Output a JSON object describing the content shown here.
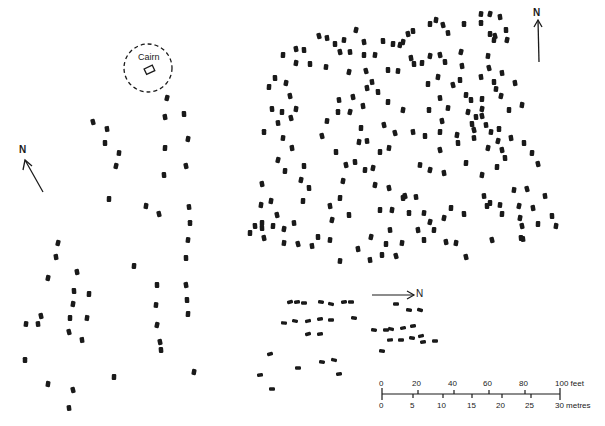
{
  "figure": {
    "type": "archaeological site plan",
    "ink_color": "#1a1a1a",
    "background": "#ffffff"
  },
  "labels": {
    "cairn": "Cairn",
    "north_left": "N",
    "north_right": "N",
    "north_bottom": "N"
  },
  "scale_bar": {
    "feet_ticks": [
      "0",
      "20",
      "40",
      "60",
      "80",
      "100 feet"
    ],
    "metre_ticks": [
      "0",
      "5",
      "10",
      "15",
      "20",
      "25",
      "30 metres"
    ],
    "feet_unit": "feet",
    "metre_unit": "metres"
  },
  "north_arrows": [
    {
      "id": "left",
      "x1": 43,
      "y1": 192,
      "x2": 25,
      "y2": 160,
      "label_x": 19,
      "label_y": 145
    },
    {
      "id": "right",
      "x1": 539,
      "y1": 62,
      "x2": 538,
      "y2": 20,
      "label_x": 533,
      "label_y": 8
    },
    {
      "id": "bottom",
      "x1": 372,
      "y1": 295,
      "x2": 414,
      "y2": 295,
      "label_x": 415,
      "label_y": 289
    }
  ],
  "stones": {
    "left_group": [
      [
        93,
        122
      ],
      [
        107,
        129
      ],
      [
        105,
        143
      ],
      [
        119,
        153
      ],
      [
        116,
        166
      ],
      [
        165,
        117
      ],
      [
        184,
        114
      ],
      [
        165,
        148
      ],
      [
        188,
        139
      ],
      [
        186,
        166
      ],
      [
        164,
        175
      ],
      [
        109,
        199
      ],
      [
        146,
        206
      ],
      [
        159,
        214
      ],
      [
        189,
        207
      ],
      [
        190,
        223
      ],
      [
        188,
        240
      ],
      [
        58,
        243
      ],
      [
        56,
        257
      ],
      [
        186,
        258
      ],
      [
        134,
        266
      ],
      [
        48,
        278
      ],
      [
        77,
        272
      ],
      [
        74,
        291
      ],
      [
        89,
        294
      ],
      [
        73,
        304
      ],
      [
        41,
        316
      ],
      [
        38,
        324
      ],
      [
        70,
        318
      ],
      [
        87,
        318
      ],
      [
        69,
        332
      ],
      [
        82,
        340
      ],
      [
        157,
        285
      ],
      [
        156,
        305
      ],
      [
        157,
        325
      ],
      [
        186,
        285
      ],
      [
        187,
        300
      ],
      [
        188,
        314
      ],
      [
        194,
        372
      ],
      [
        160,
        342
      ],
      [
        161,
        350
      ],
      [
        114,
        377
      ],
      [
        48,
        384
      ],
      [
        73,
        390
      ],
      [
        69,
        408
      ],
      [
        25,
        360
      ],
      [
        26,
        324
      ],
      [
        167,
        98
      ]
    ],
    "main_group": [
      [
        319,
        36
      ],
      [
        327,
        38
      ],
      [
        335,
        44
      ],
      [
        344,
        40
      ],
      [
        356,
        30
      ],
      [
        364,
        42
      ],
      [
        383,
        41
      ],
      [
        393,
        44
      ],
      [
        403,
        42
      ],
      [
        408,
        34
      ],
      [
        413,
        31
      ],
      [
        430,
        24
      ],
      [
        436,
        20
      ],
      [
        443,
        25
      ],
      [
        448,
        33
      ],
      [
        464,
        24
      ],
      [
        481,
        14
      ],
      [
        490,
        14
      ],
      [
        500,
        17
      ],
      [
        506,
        30
      ],
      [
        494,
        40
      ],
      [
        507,
        40
      ],
      [
        296,
        49
      ],
      [
        304,
        50
      ],
      [
        283,
        55
      ],
      [
        296,
        63
      ],
      [
        340,
        52
      ],
      [
        350,
        52
      ],
      [
        364,
        55
      ],
      [
        375,
        55
      ],
      [
        366,
        71
      ],
      [
        372,
        82
      ],
      [
        388,
        70
      ],
      [
        398,
        71
      ],
      [
        400,
        45
      ],
      [
        411,
        58
      ],
      [
        414,
        64
      ],
      [
        422,
        63
      ],
      [
        430,
        56
      ],
      [
        440,
        55
      ],
      [
        445,
        62
      ],
      [
        428,
        84
      ],
      [
        438,
        77
      ],
      [
        453,
        85
      ],
      [
        440,
        98
      ],
      [
        429,
        110
      ],
      [
        448,
        108
      ],
      [
        461,
        52
      ],
      [
        462,
        66
      ],
      [
        460,
        80
      ],
      [
        466,
        95
      ],
      [
        468,
        112
      ],
      [
        442,
        121
      ],
      [
        472,
        124
      ],
      [
        440,
        132
      ],
      [
        457,
        135
      ],
      [
        440,
        150
      ],
      [
        474,
        138
      ],
      [
        490,
        34
      ],
      [
        488,
        56
      ],
      [
        495,
        36
      ],
      [
        481,
        77
      ],
      [
        310,
        64
      ],
      [
        326,
        67
      ],
      [
        349,
        72
      ],
      [
        367,
        88
      ],
      [
        275,
        78
      ],
      [
        269,
        87
      ],
      [
        286,
        83
      ],
      [
        290,
        96
      ],
      [
        272,
        109
      ],
      [
        282,
        112
      ],
      [
        296,
        109
      ],
      [
        291,
        118
      ],
      [
        278,
        123
      ],
      [
        264,
        132
      ],
      [
        283,
        138
      ],
      [
        278,
        160
      ],
      [
        292,
        148
      ],
      [
        304,
        166
      ],
      [
        285,
        171
      ],
      [
        301,
        180
      ],
      [
        262,
        184
      ],
      [
        309,
        188
      ],
      [
        303,
        201
      ],
      [
        271,
        201
      ],
      [
        277,
        215
      ],
      [
        294,
        223
      ],
      [
        262,
        223
      ],
      [
        284,
        243
      ],
      [
        298,
        244
      ],
      [
        312,
        246
      ],
      [
        318,
        237
      ],
      [
        330,
        240
      ],
      [
        332,
        220
      ],
      [
        330,
        206
      ],
      [
        349,
        215
      ],
      [
        340,
        198
      ],
      [
        343,
        181
      ],
      [
        346,
        165
      ],
      [
        355,
        162
      ],
      [
        361,
        128
      ],
      [
        359,
        142
      ],
      [
        322,
        136
      ],
      [
        339,
        100
      ],
      [
        338,
        112
      ],
      [
        327,
        121
      ],
      [
        350,
        112
      ],
      [
        363,
        106
      ],
      [
        336,
        152
      ],
      [
        365,
        170
      ],
      [
        373,
        168
      ],
      [
        353,
        97
      ],
      [
        378,
        92
      ],
      [
        388,
        102
      ],
      [
        403,
        110
      ],
      [
        384,
        125
      ],
      [
        367,
        141
      ],
      [
        380,
        152
      ],
      [
        389,
        148
      ],
      [
        395,
        133
      ],
      [
        413,
        132
      ],
      [
        425,
        136
      ],
      [
        420,
        165
      ],
      [
        430,
        170
      ],
      [
        444,
        173
      ],
      [
        458,
        143
      ],
      [
        466,
        163
      ],
      [
        375,
        185
      ],
      [
        389,
        188
      ],
      [
        403,
        198
      ],
      [
        380,
        210
      ],
      [
        392,
        210
      ],
      [
        405,
        196
      ],
      [
        416,
        197
      ],
      [
        409,
        213
      ],
      [
        424,
        213
      ],
      [
        430,
        222
      ],
      [
        418,
        230
      ],
      [
        424,
        240
      ],
      [
        434,
        230
      ],
      [
        444,
        218
      ],
      [
        446,
        242
      ],
      [
        464,
        214
      ],
      [
        451,
        208
      ],
      [
        456,
        243
      ],
      [
        466,
        257
      ],
      [
        390,
        230
      ],
      [
        386,
        244
      ],
      [
        402,
        243
      ],
      [
        396,
        256
      ],
      [
        370,
        260
      ],
      [
        382,
        255
      ],
      [
        340,
        261
      ],
      [
        371,
        237
      ],
      [
        358,
        249
      ],
      [
        262,
        228
      ],
      [
        273,
        226
      ],
      [
        284,
        229
      ],
      [
        264,
        238
      ],
      [
        255,
        226
      ],
      [
        250,
        233
      ],
      [
        261,
        205
      ]
    ],
    "right_group": [
      [
        489,
        68
      ],
      [
        502,
        73
      ],
      [
        494,
        82
      ],
      [
        496,
        89
      ],
      [
        501,
        96
      ],
      [
        515,
        83
      ],
      [
        471,
        100
      ],
      [
        482,
        99
      ],
      [
        482,
        109
      ],
      [
        482,
        116
      ],
      [
        476,
        117
      ],
      [
        509,
        110
      ],
      [
        522,
        105
      ],
      [
        474,
        130
      ],
      [
        486,
        125
      ],
      [
        499,
        129
      ],
      [
        491,
        132
      ],
      [
        498,
        141
      ],
      [
        511,
        138
      ],
      [
        524,
        143
      ],
      [
        532,
        153
      ],
      [
        488,
        148
      ],
      [
        502,
        150
      ],
      [
        505,
        158
      ],
      [
        497,
        167
      ],
      [
        482,
        175
      ],
      [
        538,
        164
      ],
      [
        484,
        196
      ],
      [
        490,
        203
      ],
      [
        514,
        190
      ],
      [
        527,
        189
      ],
      [
        545,
        196
      ],
      [
        487,
        206
      ],
      [
        500,
        205
      ],
      [
        519,
        206
      ],
      [
        533,
        208
      ],
      [
        552,
        216
      ],
      [
        502,
        214
      ],
      [
        520,
        218
      ],
      [
        522,
        226
      ],
      [
        521,
        238
      ],
      [
        538,
        224
      ],
      [
        556,
        226
      ],
      [
        492,
        240
      ],
      [
        523,
        239
      ],
      [
        481,
        23
      ]
    ],
    "bottom_group": [
      [
        290,
        302
      ],
      [
        297,
        302
      ],
      [
        304,
        303
      ],
      [
        321,
        302
      ],
      [
        331,
        304
      ],
      [
        344,
        302
      ],
      [
        351,
        302
      ],
      [
        284,
        323
      ],
      [
        295,
        321
      ],
      [
        308,
        321
      ],
      [
        320,
        319
      ],
      [
        331,
        320
      ],
      [
        354,
        318
      ],
      [
        308,
        334
      ],
      [
        320,
        334
      ],
      [
        396,
        304
      ],
      [
        409,
        310
      ],
      [
        420,
        310
      ],
      [
        413,
        326
      ],
      [
        386,
        330
      ],
      [
        374,
        330
      ],
      [
        391,
        329
      ],
      [
        403,
        328
      ],
      [
        390,
        340
      ],
      [
        401,
        340
      ],
      [
        412,
        338
      ],
      [
        421,
        336
      ],
      [
        423,
        342
      ],
      [
        435,
        341
      ],
      [
        382,
        351
      ],
      [
        270,
        354
      ],
      [
        260,
        375
      ],
      [
        298,
        368
      ],
      [
        322,
        362
      ],
      [
        334,
        360
      ],
      [
        339,
        374
      ],
      [
        272,
        389
      ]
    ]
  },
  "cairn": {
    "cx": 148,
    "cy": 68,
    "r": 24,
    "stone": {
      "x": 149,
      "y": 70,
      "w": 9,
      "h": 6,
      "rot": -25
    }
  }
}
